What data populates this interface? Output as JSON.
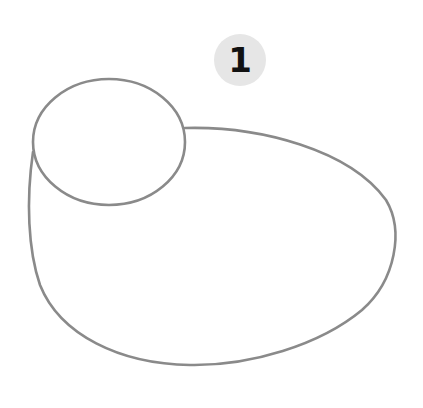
{
  "diagram": {
    "type": "line-drawing",
    "step_badge": {
      "label": "1",
      "fill": "#e6e6e6",
      "text_color": "#111111",
      "cx": 240,
      "cy": 60,
      "r": 26
    },
    "stroke_color": "#8a8a8a",
    "shapes": [
      {
        "name": "head-oval",
        "cx": 109,
        "cy": 142,
        "rx": 76,
        "ry": 63
      },
      {
        "name": "body-outline",
        "path": "M185,128 C260,126 350,150 386,200 C404,230 396,280 362,310 C320,345 250,366 190,365 C120,364 60,335 40,285 C28,250 26,200 33,152"
      }
    ]
  }
}
